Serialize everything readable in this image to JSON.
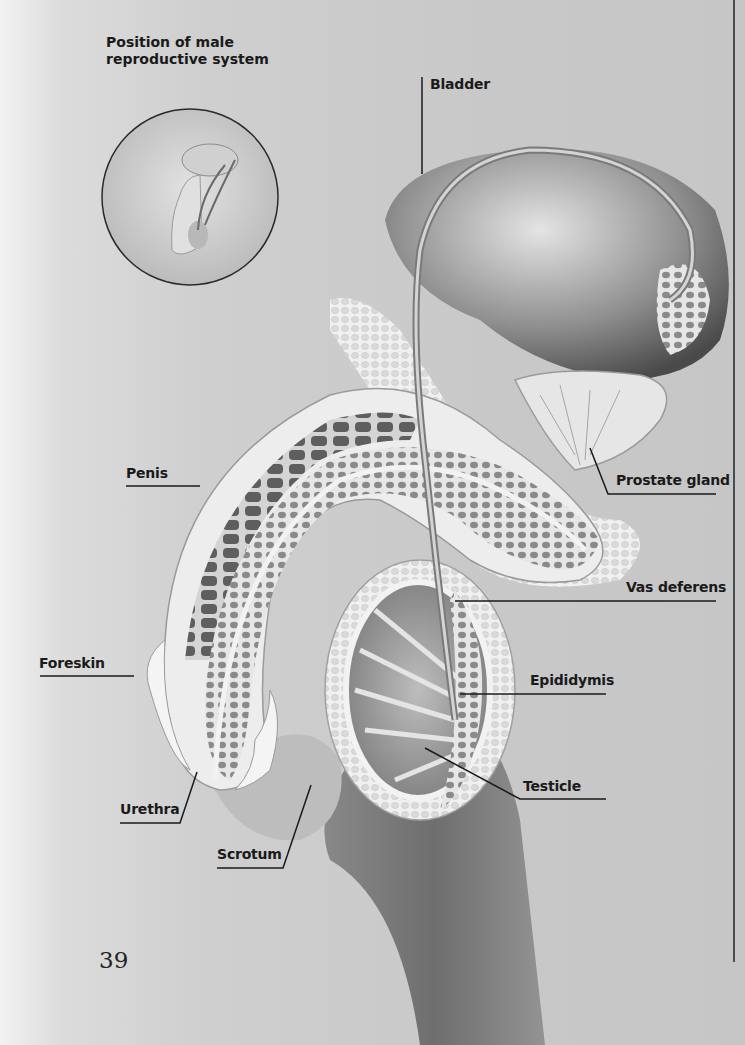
{
  "inset": {
    "title_line1": "Position of male",
    "title_line2": "reproductive system"
  },
  "labels": {
    "bladder": "Bladder",
    "prostate_gland": "Prostate gland",
    "penis": "Penis",
    "vas_deferens": "Vas deferens",
    "foreskin": "Foreskin",
    "epididymis": "Epididymis",
    "testicle": "Testicle",
    "urethra": "Urethra",
    "scrotum": "Scrotum"
  },
  "page_number": "39",
  "colors": {
    "background": "#c9c9c9",
    "tissue_light": "#ececec",
    "tissue_mid": "#9a9a9a",
    "tissue_dark": "#5a5a5a",
    "leader_line": "#1a1a1a"
  }
}
